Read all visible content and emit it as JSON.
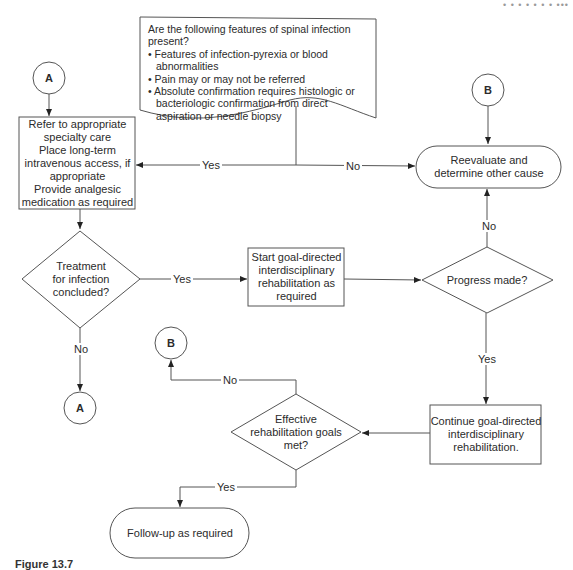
{
  "page": {
    "header_fragment": "• • • • • •   •   •••",
    "caption_fragment": "Figure 13.7"
  },
  "flowchart": {
    "start_question": {
      "title": "Are the following features of spinal infection present?",
      "bullets": [
        "Features of infection-pyrexia or blood abnormalities",
        "Pain may or may not be referred",
        "Absolute confirmation requires histologic or bacteriologic confirmation from direct aspiration or needle biopsy"
      ]
    },
    "connectors": {
      "a_top": "A",
      "b_top": "B",
      "b_bottom": "B",
      "a_bottom": "A"
    },
    "nodes": {
      "refer_box": "Refer to appropriate specialty care Place long-term intravenous access, if appropriate Provide analgesic medication as required",
      "refer_lines": [
        "Refer to appropriate",
        "specialty care",
        "Place long-term",
        "intravenous access, if",
        "appropriate",
        "Provide analgesic",
        "medication as required"
      ],
      "reevaluate": [
        "Reevaluate and",
        "determine other cause"
      ],
      "treatment_decision": [
        "Treatment",
        "for infection",
        "concluded?"
      ],
      "start_rehab": [
        "Start goal-directed",
        "interdisciplinary",
        "rehabilitation as",
        "required"
      ],
      "progress_decision": [
        "Progress made?"
      ],
      "continue_rehab": [
        "Continue goal-directed",
        "interdisciplinary",
        "rehabilitation."
      ],
      "goals_decision": [
        "Effective",
        "rehabilitation goals",
        "met?"
      ],
      "follow_up": [
        "Follow-up as required"
      ]
    },
    "edge_labels": {
      "start_yes": "Yes",
      "start_no": "No",
      "treatment_yes": "Yes",
      "treatment_no": "No",
      "progress_no": "No",
      "progress_yes": "Yes",
      "goals_no": "No",
      "goals_yes": "Yes"
    },
    "colors": {
      "stroke": "#555555",
      "text": "#2b2b2b",
      "background": "#ffffff"
    }
  }
}
